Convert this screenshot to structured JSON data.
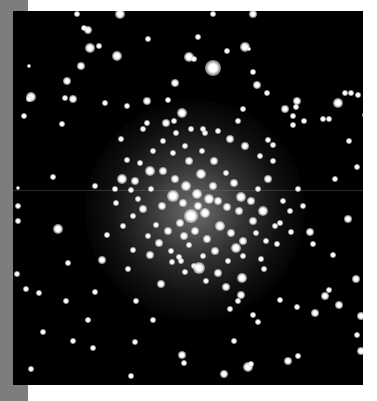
{
  "image": {
    "subject": "globular star cluster",
    "colors": {
      "page_background": "#ffffff",
      "side_strip": "#7d7d7d",
      "sky": "#000000",
      "star": "#ffffff"
    },
    "photo_frame": {
      "x": 13,
      "y": 11,
      "width": 350,
      "height": 374
    },
    "scan_line_y": 179,
    "core": {
      "cx": 182,
      "cy": 199,
      "radius": 110
    },
    "stars": [
      [
        107,
        3,
        5
      ],
      [
        240,
        3,
        4
      ],
      [
        86,
        35,
        3
      ],
      [
        75,
        19,
        4
      ],
      [
        77,
        37,
        5
      ],
      [
        135,
        28,
        3
      ],
      [
        104,
        45,
        5
      ],
      [
        68,
        55,
        4
      ],
      [
        16,
        55,
        2
      ],
      [
        54,
        70,
        4
      ],
      [
        176,
        46,
        5
      ],
      [
        181,
        48,
        3
      ],
      [
        18,
        86,
        5
      ],
      [
        16,
        88,
        3
      ],
      [
        11,
        105,
        3
      ],
      [
        60,
        88,
        4
      ],
      [
        52,
        87,
        3
      ],
      [
        92,
        92,
        3
      ],
      [
        114,
        95,
        3
      ],
      [
        134,
        90,
        4
      ],
      [
        49,
        113,
        3
      ],
      [
        64,
        3,
        3
      ],
      [
        71,
        17,
        3
      ],
      [
        185,
        26,
        3
      ],
      [
        232,
        36,
        5
      ],
      [
        236,
        38,
        2
      ],
      [
        240,
        61,
        3
      ],
      [
        244,
        74,
        4
      ],
      [
        254,
        82,
        3
      ],
      [
        284,
        90,
        4
      ],
      [
        283,
        96,
        3
      ],
      [
        272,
        98,
        4
      ],
      [
        280,
        105,
        3
      ],
      [
        325,
        92,
        5
      ],
      [
        332,
        82,
        3
      ],
      [
        316,
        108,
        3
      ],
      [
        230,
        98,
        3
      ],
      [
        162,
        72,
        4
      ],
      [
        200,
        57,
        8
      ],
      [
        214,
        40,
        3
      ],
      [
        200,
        3,
        3
      ],
      [
        155,
        89,
        3
      ],
      [
        130,
        118,
        3
      ],
      [
        134,
        112,
        3
      ],
      [
        153,
        112,
        4
      ],
      [
        161,
        110,
        3
      ],
      [
        169,
        102,
        5
      ],
      [
        190,
        118,
        3
      ],
      [
        225,
        110,
        3
      ],
      [
        255,
        129,
        3
      ],
      [
        260,
        134,
        3
      ],
      [
        280,
        114,
        3
      ],
      [
        291,
        110,
        3
      ],
      [
        310,
        108,
        3
      ],
      [
        338,
        82,
        3
      ],
      [
        345,
        84,
        3
      ],
      [
        352,
        104,
        3
      ],
      [
        336,
        130,
        3
      ],
      [
        45,
        218,
        5
      ],
      [
        55,
        252,
        3
      ],
      [
        26,
        282,
        3
      ],
      [
        122,
        331,
        3
      ],
      [
        171,
        352,
        3
      ],
      [
        169,
        344,
        4
      ],
      [
        221,
        330,
        3
      ],
      [
        235,
        356,
        5
      ],
      [
        211,
        363,
        4
      ],
      [
        223,
        237,
        5
      ],
      [
        229,
        267,
        5
      ],
      [
        228,
        284,
        4
      ],
      [
        240,
        304,
        3
      ],
      [
        217,
        298,
        3
      ],
      [
        245,
        311,
        3
      ],
      [
        251,
        258,
        3
      ],
      [
        267,
        289,
        3
      ],
      [
        284,
        296,
        3
      ],
      [
        312,
        285,
        4
      ],
      [
        316,
        279,
        3
      ],
      [
        326,
        294,
        4
      ],
      [
        348,
        305,
        4
      ],
      [
        344,
        324,
        3
      ],
      [
        348,
        340,
        4
      ],
      [
        285,
        345,
        3
      ],
      [
        275,
        350,
        4
      ],
      [
        238,
        353,
        3
      ],
      [
        302,
        302,
        4
      ],
      [
        320,
        244,
        3
      ],
      [
        297,
        221,
        4
      ],
      [
        300,
        233,
        3
      ],
      [
        267,
        212,
        3
      ],
      [
        322,
        168,
        3
      ],
      [
        344,
        156,
        3
      ],
      [
        343,
        268,
        4
      ],
      [
        335,
        208,
        4
      ],
      [
        5,
        195,
        3
      ],
      [
        5,
        210,
        3
      ],
      [
        4,
        263,
        3
      ],
      [
        80,
        337,
        3
      ],
      [
        123,
        290,
        3
      ],
      [
        82,
        281,
        3
      ],
      [
        40,
        166,
        3
      ],
      [
        94,
        224,
        3
      ],
      [
        89,
        249,
        4
      ],
      [
        115,
        258,
        3
      ],
      [
        148,
        273,
        4
      ],
      [
        120,
        239,
        3
      ],
      [
        137,
        244,
        4
      ],
      [
        159,
        251,
        3
      ],
      [
        166,
        246,
        3
      ],
      [
        176,
        234,
        3
      ],
      [
        172,
        261,
        3
      ],
      [
        140,
        309,
        3
      ],
      [
        13,
        278,
        3
      ],
      [
        53,
        290,
        3
      ],
      [
        75,
        309,
        3
      ],
      [
        60,
        330,
        3
      ],
      [
        30,
        321,
        3
      ],
      [
        118,
        365,
        3
      ],
      [
        18,
        358,
        3
      ],
      [
        5,
        177,
        2
      ],
      [
        82,
        175,
        3
      ],
      [
        137,
        160,
        5
      ],
      [
        122,
        170,
        4
      ],
      [
        108,
        128,
        3
      ],
      [
        114,
        149,
        3
      ],
      [
        118,
        179,
        3
      ],
      [
        102,
        178,
        3
      ],
      [
        103,
        192,
        3
      ],
      [
        130,
        198,
        4
      ],
      [
        149,
        195,
        4
      ],
      [
        160,
        185,
        6
      ],
      [
        170,
        192,
        4
      ],
      [
        178,
        205,
        7
      ],
      [
        192,
        202,
        5
      ],
      [
        205,
        190,
        4
      ],
      [
        214,
        196,
        4
      ],
      [
        200,
        175,
        4
      ],
      [
        188,
        163,
        5
      ],
      [
        176,
        150,
        4
      ],
      [
        160,
        142,
        3
      ],
      [
        172,
        135,
        3
      ],
      [
        189,
        140,
        3
      ],
      [
        201,
        150,
        4
      ],
      [
        213,
        162,
        3
      ],
      [
        221,
        172,
        4
      ],
      [
        228,
        186,
        5
      ],
      [
        226,
        200,
        4
      ],
      [
        238,
        190,
        4
      ],
      [
        240,
        210,
        4
      ],
      [
        250,
        200,
        5
      ],
      [
        245,
        178,
        3
      ],
      [
        255,
        168,
        4
      ],
      [
        260,
        150,
        3
      ],
      [
        247,
        145,
        3
      ],
      [
        232,
        135,
        4
      ],
      [
        217,
        128,
        4
      ],
      [
        205,
        120,
        3
      ],
      [
        192,
        122,
        3
      ],
      [
        178,
        118,
        3
      ],
      [
        163,
        122,
        3
      ],
      [
        150,
        130,
        3
      ],
      [
        140,
        140,
        3
      ],
      [
        127,
        152,
        3
      ],
      [
        150,
        160,
        4
      ],
      [
        162,
        168,
        4
      ],
      [
        173,
        175,
        5
      ],
      [
        184,
        183,
        5
      ],
      [
        196,
        188,
        5
      ],
      [
        185,
        195,
        4
      ],
      [
        167,
        212,
        4
      ],
      [
        155,
        220,
        4
      ],
      [
        143,
        214,
        3
      ],
      [
        135,
        225,
        3
      ],
      [
        146,
        232,
        4
      ],
      [
        158,
        240,
        3
      ],
      [
        171,
        225,
        4
      ],
      [
        182,
        220,
        4
      ],
      [
        194,
        228,
        4
      ],
      [
        207,
        215,
        5
      ],
      [
        218,
        222,
        4
      ],
      [
        230,
        230,
        4
      ],
      [
        243,
        222,
        3
      ],
      [
        253,
        230,
        3
      ],
      [
        262,
        215,
        3
      ],
      [
        202,
        240,
        4
      ],
      [
        190,
        245,
        3
      ],
      [
        215,
        250,
        3
      ],
      [
        205,
        262,
        4
      ],
      [
        193,
        270,
        3
      ],
      [
        181,
        255,
        3
      ],
      [
        168,
        250,
        3
      ],
      [
        230,
        245,
        3
      ],
      [
        248,
        248,
        3
      ],
      [
        186,
        257,
        6
      ],
      [
        213,
        276,
        4
      ],
      [
        225,
        290,
        3
      ],
      [
        120,
        205,
        3
      ],
      [
        110,
        215,
        3
      ],
      [
        125,
        188,
        3
      ],
      [
        138,
        178,
        3
      ],
      [
        270,
        190,
        3
      ],
      [
        277,
        200,
        3
      ],
      [
        109,
        168,
        5
      ],
      [
        264,
        233,
        3
      ],
      [
        278,
        221,
        3
      ],
      [
        290,
        195,
        3
      ],
      [
        285,
        178,
        3
      ]
    ]
  }
}
